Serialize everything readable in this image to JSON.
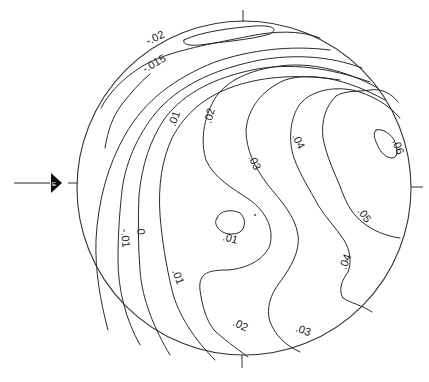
{
  "diagram": {
    "type": "stereonet-contour-plot",
    "projection_circle": {
      "cx": 244,
      "cy": 188,
      "r": 167
    },
    "ticks": [
      "N",
      "E",
      "S",
      "W"
    ],
    "direction_marker": {
      "type": "arrow-pointer",
      "side": "west",
      "icon": "triangle-arrow-icon"
    },
    "contour_labels": [
      {
        "text": "-.02",
        "x": 148,
        "y": 45,
        "rotate": -25
      },
      {
        "text": "-.015",
        "x": 145,
        "y": 73,
        "rotate": -30
      },
      {
        "text": "-.01",
        "x": 121,
        "y": 229,
        "rotate": 85
      },
      {
        "text": "0",
        "x": 137,
        "y": 229,
        "rotate": 85
      },
      {
        "text": ".01",
        "x": 175,
        "y": 127,
        "rotate": -70
      },
      {
        "text": ".01",
        "x": 172,
        "y": 271,
        "rotate": 70
      },
      {
        "text": ".01",
        "x": 222,
        "y": 240,
        "rotate": 15
      },
      {
        "text": ".02",
        "x": 211,
        "y": 124,
        "rotate": -75
      },
      {
        "text": ".02",
        "x": 232,
        "y": 325,
        "rotate": 25
      },
      {
        "text": ".03",
        "x": 248,
        "y": 157,
        "rotate": 65
      },
      {
        "text": ".03",
        "x": 295,
        "y": 331,
        "rotate": 20
      },
      {
        "text": ".04",
        "x": 292,
        "y": 136,
        "rotate": 65
      },
      {
        "text": ".04",
        "x": 346,
        "y": 270,
        "rotate": -70
      },
      {
        "text": ".05",
        "x": 357,
        "y": 211,
        "rotate": 55
      },
      {
        "text": ".06",
        "x": 392,
        "y": 141,
        "rotate": 70
      }
    ]
  }
}
